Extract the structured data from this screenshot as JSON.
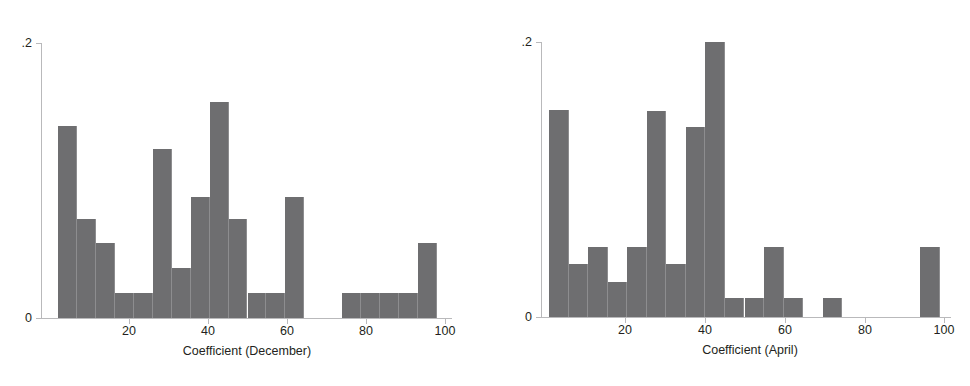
{
  "figure": {
    "background": "#ffffff",
    "bar_color": "#6e6e70",
    "axis_color": "#b9b9bb",
    "text_color": "#231f20"
  },
  "chart_data": [
    {
      "type": "bar",
      "title": "",
      "xlabel": "Coefficient (December)",
      "ylabel": "",
      "xlim": [
        0,
        104
      ],
      "ylim": [
        0,
        0.2
      ],
      "grid": false,
      "legend": "none",
      "xticks": [
        20,
        40,
        60,
        80,
        100
      ],
      "xtick_labels": [
        "20",
        "40",
        "60",
        "80",
        "100"
      ],
      "yticks": [
        0,
        0.2
      ],
      "ytick_labels": [
        "0",
        ".2"
      ],
      "bin_width": 4.8,
      "bin_starts": [
        2.0,
        6.8,
        11.6,
        16.4,
        21.2,
        26.0,
        30.8,
        35.6,
        40.4,
        45.2,
        50.0,
        54.8,
        59.6,
        64.4,
        69.2,
        74.0,
        78.8,
        83.6,
        88.4,
        93.2
      ],
      "values": [
        0.1395,
        0.072,
        0.0545,
        0.018,
        0.018,
        0.123,
        0.0365,
        0.088,
        0.157,
        0.072,
        0.018,
        0.018,
        0.088,
        0.0,
        0.0,
        0.018,
        0.018,
        0.018,
        0.018,
        0.0545
      ]
    },
    {
      "type": "bar",
      "title": "",
      "xlabel": "Coefficient (April)",
      "ylabel": "",
      "xlim": [
        0,
        104
      ],
      "ylim": [
        0,
        0.2
      ],
      "grid": false,
      "legend": "none",
      "xticks": [
        20,
        40,
        60,
        80,
        100
      ],
      "xtick_labels": [
        "20",
        "40",
        "60",
        "80",
        "100"
      ],
      "yticks": [
        0,
        0.2
      ],
      "ytick_labels": [
        "0",
        ".2"
      ],
      "bin_width": 4.9,
      "bin_starts": [
        1.0,
        5.9,
        10.8,
        15.7,
        20.6,
        25.5,
        30.4,
        35.3,
        40.2,
        45.1,
        50.0,
        54.9,
        59.8,
        64.7,
        69.6,
        74.5,
        79.4,
        84.3,
        89.2,
        94.1
      ],
      "values": [
        0.1505,
        0.0385,
        0.051,
        0.0255,
        0.051,
        0.1495,
        0.0385,
        0.1385,
        0.2,
        0.014,
        0.014,
        0.051,
        0.014,
        0.0,
        0.014,
        0.0,
        0.0,
        0.0,
        0.0,
        0.051
      ]
    }
  ]
}
